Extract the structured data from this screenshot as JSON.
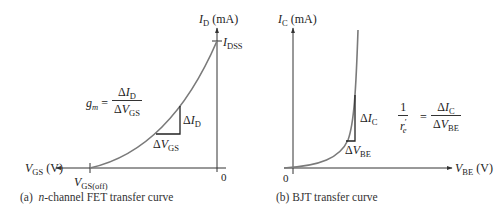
{
  "panel_a": {
    "caption_prefix": "(a)",
    "caption_italic": "n",
    "caption_rest": "-channel FET transfer curve",
    "y_axis": {
      "symbol": "I",
      "sub": "D",
      "unit": "(mA)"
    },
    "x_axis": {
      "symbol": "V",
      "sub": "GS",
      "unit": "(V)"
    },
    "idss": {
      "symbol": "I",
      "sub": "DSS"
    },
    "vgs_off": {
      "symbol": "V",
      "sub": "GS(off)"
    },
    "origin": "0",
    "formula": {
      "lhs_symbol": "g",
      "lhs_sub": "m",
      "equals": "=",
      "num_delta": "Δ",
      "num_symbol": "I",
      "num_sub": "D",
      "den_delta": "Δ",
      "den_symbol": "V",
      "den_sub": "GS"
    },
    "delta_vertical": {
      "delta": "Δ",
      "symbol": "I",
      "sub": "D"
    },
    "delta_horizontal": {
      "delta": "Δ",
      "symbol": "V",
      "sub": "GS"
    }
  },
  "panel_b": {
    "caption": "(b) BJT transfer curve",
    "y_axis": {
      "symbol": "I",
      "sub": "C",
      "unit": "(mA)"
    },
    "x_axis": {
      "symbol": "V",
      "sub": "BE",
      "unit": "(V)"
    },
    "origin": "0",
    "formula": {
      "lhs_num": "1",
      "lhs_den_symbol": "r",
      "lhs_den_sub": "e",
      "lhs_den_prime": "′",
      "equals": "=",
      "num_delta": "Δ",
      "num_symbol": "I",
      "num_sub": "C",
      "den_delta": "Δ",
      "den_symbol": "V",
      "den_sub": "BE"
    },
    "delta_vertical": {
      "delta": "Δ",
      "symbol": "I",
      "sub": "C"
    },
    "delta_horizontal": {
      "delta": "Δ",
      "symbol": "V",
      "sub": "BE"
    }
  },
  "colors": {
    "axis": "#333333",
    "curve": "#7a7a7a",
    "triangle": "#222222",
    "text": "#222222"
  }
}
